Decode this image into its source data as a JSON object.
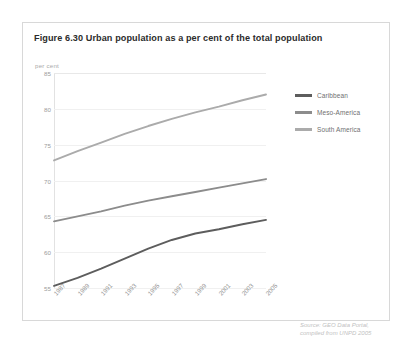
{
  "figure": {
    "title": "Figure 6.30 Urban population as a per cent of the total population",
    "unit_label": "per cent",
    "source_line1": "Source: GEO Data Portal,",
    "source_line2": "compiled from UNPD 2005"
  },
  "legend": {
    "items": [
      {
        "label": "Caribbean",
        "color": "#5d5d5d"
      },
      {
        "label": "Meso-America",
        "color": "#8c8c8c"
      },
      {
        "label": "South America",
        "color": "#ababab"
      }
    ]
  },
  "chart_data": {
    "type": "line",
    "title": "Figure 6.30 Urban population as a per cent of the total population",
    "xlabel": "",
    "ylabel": "per cent",
    "ylim": [
      55,
      85
    ],
    "yticks": [
      55,
      60,
      65,
      70,
      75,
      80,
      85
    ],
    "grid": true,
    "legend_position": "right",
    "categories": [
      "1987",
      "1989",
      "1991",
      "1993",
      "1995",
      "1997",
      "1999",
      "2001",
      "2003",
      "2005"
    ],
    "x": [
      1987,
      1989,
      1991,
      1993,
      1995,
      1997,
      1999,
      2001,
      2003,
      2005
    ],
    "series": [
      {
        "name": "Caribbean",
        "color": "#5d5d5d",
        "values": [
          55.3,
          56.4,
          57.7,
          59.1,
          60.5,
          61.7,
          62.6,
          63.2,
          63.9,
          64.5
        ]
      },
      {
        "name": "Meso-America",
        "color": "#8c8c8c",
        "values": [
          64.3,
          65.0,
          65.7,
          66.5,
          67.2,
          67.8,
          68.4,
          69.0,
          69.6,
          70.2
        ]
      },
      {
        "name": "South America",
        "color": "#ababab",
        "values": [
          72.8,
          74.1,
          75.3,
          76.5,
          77.6,
          78.6,
          79.5,
          80.3,
          81.2,
          82.0
        ]
      }
    ]
  }
}
